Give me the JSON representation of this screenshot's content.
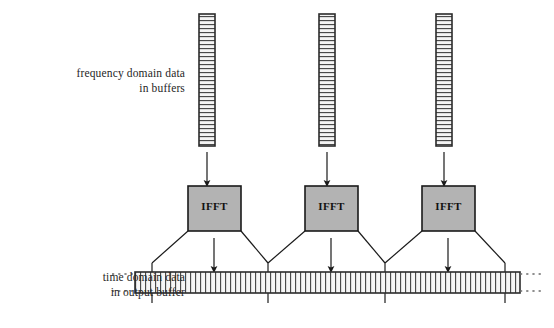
{
  "diagram": {
    "labels": {
      "frequency_line1": "frequency domain data",
      "frequency_line2": "in buffers",
      "time_line1": "time domain data",
      "time_line2": "in output buffer"
    },
    "blocks": [
      {
        "label": "IFFT",
        "x": 188,
        "y": 186,
        "w": 53,
        "h": 45
      },
      {
        "label": "IFFT",
        "x": 305,
        "y": 186,
        "w": 53,
        "h": 45
      },
      {
        "label": "IFFT",
        "x": 422,
        "y": 186,
        "w": 53,
        "h": 45
      }
    ],
    "input_buffers": [
      {
        "x": 199,
        "y": 14,
        "w": 16,
        "h": 132,
        "cells": 33
      },
      {
        "x": 319,
        "y": 14,
        "w": 16,
        "h": 132,
        "cells": 33
      },
      {
        "x": 436,
        "y": 14,
        "w": 16,
        "h": 132,
        "cells": 33
      }
    ],
    "output_buffer": {
      "x": 135,
      "y": 272,
      "w": 385,
      "h": 21,
      "cells": 77,
      "dotted_left_x": 112,
      "dotted_right_x": 543
    },
    "overlap_ticks": [
      152,
      268,
      385,
      505
    ],
    "colors": {
      "block_fill": "#b3b3b3",
      "block_stroke": "#1a1a1a",
      "line": "#1a1a1a",
      "buffer_fill": "#f2f2f2",
      "buffer_stroke": "#333333",
      "background": "#ffffff",
      "text": "#262626"
    }
  }
}
